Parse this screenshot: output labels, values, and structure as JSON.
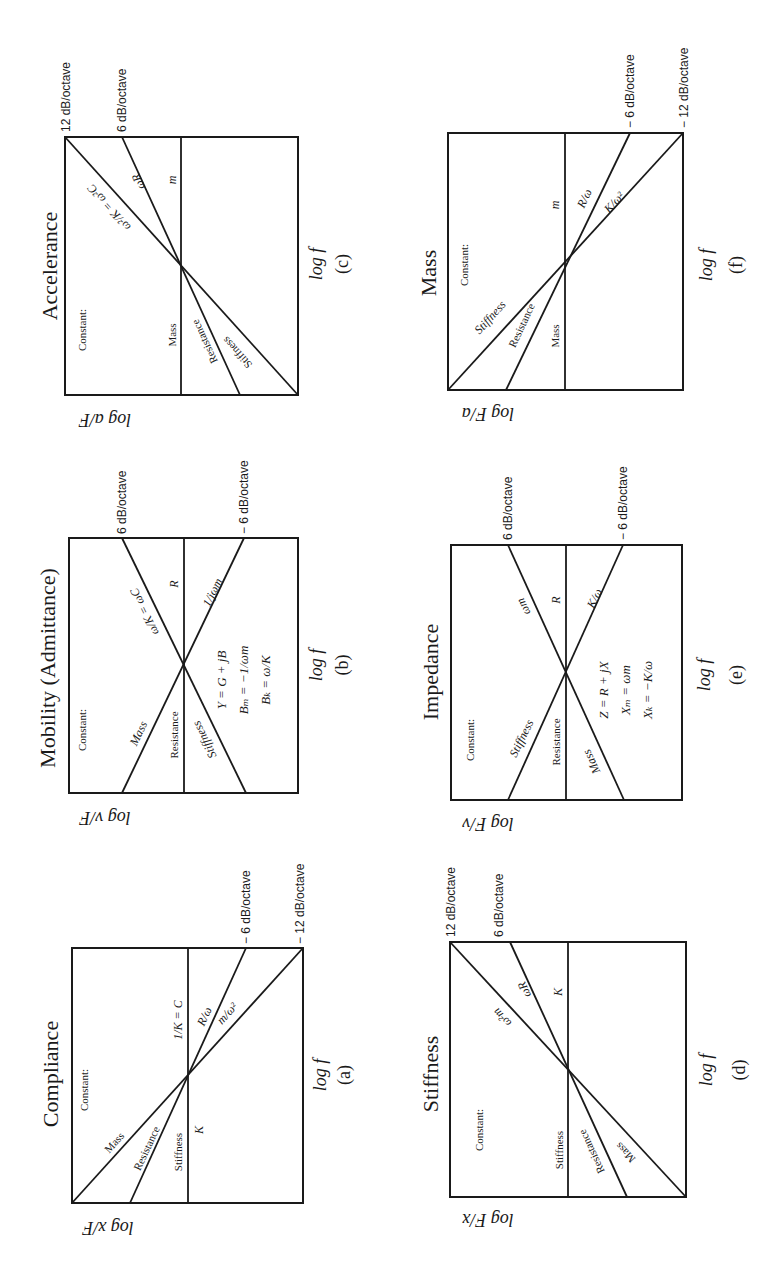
{
  "page": {
    "orientation": "rotated -90 degrees (landscape page scanned in portrait)",
    "background": "#ffffff",
    "ink": "#1a1a1a"
  },
  "common": {
    "x_axis_label": "log f",
    "constant_label": "Constant:"
  },
  "panels": [
    {
      "id": "a",
      "letter": "(a)",
      "title": "Compliance",
      "y_axis_label": "log x/F",
      "box": {
        "x1": 72,
        "x2": 303,
        "y1": 948,
        "y2": 1203
      },
      "lines": [
        {
          "from": [
            72,
            1203
          ],
          "to": [
            303,
            948
          ],
          "slope_label": "− 12 dB/octave"
        },
        {
          "from": [
            130,
            1203
          ],
          "to": [
            246,
            948
          ],
          "slope_label": "− 6 dB/octave"
        },
        {
          "from": [
            188,
            1203
          ],
          "to": [
            188,
            948
          ],
          "slope_label": ""
        }
      ],
      "low_freq_labels": [
        "Mass",
        "Resistance",
        "Stiffness"
      ],
      "high_freq_labels": [
        "m/ω²",
        "R/ω",
        "1/K = C"
      ],
      "extra_label": "K",
      "equations": []
    },
    {
      "id": "b",
      "letter": "(b)",
      "title": "Mobility (Admittance)",
      "y_axis_label": "log v/F",
      "box": {
        "x1": 69,
        "x2": 298,
        "y1": 538,
        "y2": 793
      },
      "lines": [
        {
          "from": [
            246,
            793
          ],
          "to": [
            122,
            538
          ],
          "slope_label": "6 dB/octave"
        },
        {
          "from": [
            122,
            793
          ],
          "to": [
            244,
            538
          ],
          "slope_label": "− 6 dB/octave"
        },
        {
          "from": [
            184,
            793
          ],
          "to": [
            184,
            538
          ],
          "slope_label": ""
        }
      ],
      "low_freq_labels": [
        "Mass",
        "Resistance",
        "Stiffness"
      ],
      "high_freq_labels": [
        "ω/K = ωC",
        "R",
        "1/jωm"
      ],
      "equations": [
        "Y = G + jB",
        "Bₘ = −1/ωm",
        "Bₖ = ω/K"
      ]
    },
    {
      "id": "c",
      "letter": "(c)",
      "title": "Accelerance",
      "y_axis_label": "log a/F",
      "box": {
        "x1": 65,
        "x2": 298,
        "y1": 137,
        "y2": 395
      },
      "lines": [
        {
          "from": [
            298,
            395
          ],
          "to": [
            65,
            137
          ],
          "slope_label": "12 dB/octave"
        },
        {
          "from": [
            240,
            395
          ],
          "to": [
            122,
            137
          ],
          "slope_label": "6 dB/octave"
        },
        {
          "from": [
            181,
            395
          ],
          "to": [
            181,
            137
          ],
          "slope_label": ""
        }
      ],
      "low_freq_labels": [
        "Mass",
        "Resistance",
        "Stiffness"
      ],
      "high_freq_labels": [
        "ω²/K = ω²C",
        "ωR",
        "m"
      ],
      "equations": []
    },
    {
      "id": "d",
      "letter": "(d)",
      "title": "Stiffness",
      "y_axis_label": "log F/x",
      "box": {
        "x1": 450,
        "x2": 686,
        "y1": 942,
        "y2": 1197
      },
      "lines": [
        {
          "from": [
            686,
            1197
          ],
          "to": [
            450,
            942
          ],
          "slope_label": "12 dB/octave"
        },
        {
          "from": [
            627,
            1197
          ],
          "to": [
            510,
            942
          ],
          "slope_label": "6 dB/octave"
        },
        {
          "from": [
            568,
            1197
          ],
          "to": [
            568,
            942
          ],
          "slope_label": ""
        }
      ],
      "low_freq_labels": [
        "Stiffness",
        "Resistance",
        "Mass"
      ],
      "high_freq_labels": [
        "ω²m",
        "ωR",
        "K"
      ],
      "equations": []
    },
    {
      "id": "e",
      "letter": "(e)",
      "title": "Impedance",
      "y_axis_label": "log F/v",
      "box": {
        "x1": 451,
        "x2": 682,
        "y1": 545,
        "y2": 800
      },
      "lines": [
        {
          "from": [
            624,
            800
          ],
          "to": [
            508,
            545
          ],
          "slope_label": "6 dB/octave"
        },
        {
          "from": [
            508,
            800
          ],
          "to": [
            623,
            545
          ],
          "slope_label": "− 6 dB/octave"
        },
        {
          "from": [
            566,
            800
          ],
          "to": [
            566,
            545
          ],
          "slope_label": ""
        }
      ],
      "low_freq_labels": [
        "Stiffness",
        "Resistance",
        "Mass"
      ],
      "high_freq_labels": [
        "ωm",
        "R",
        "K/ω"
      ],
      "equations": [
        "Z = R + jX",
        "Xₘ = ωm",
        "Xₖ = −K/ω"
      ]
    },
    {
      "id": "f",
      "letter": "(f)",
      "title": "Mass",
      "y_axis_label": "log F/a",
      "box": {
        "x1": 448,
        "x2": 683,
        "y1": 133,
        "y2": 390
      },
      "lines": [
        {
          "from": [
            448,
            390
          ],
          "to": [
            683,
            133
          ],
          "slope_label": "− 12 dB/octave"
        },
        {
          "from": [
            506,
            390
          ],
          "to": [
            630,
            133
          ],
          "slope_label": "− 6 dB/octave"
        },
        {
          "from": [
            565,
            390
          ],
          "to": [
            565,
            133
          ],
          "slope_label": ""
        }
      ],
      "low_freq_labels": [
        "Stiffness",
        "Resistance",
        "Mass"
      ],
      "high_freq_labels": [
        "K/ω²",
        "R/ω",
        "m"
      ],
      "equations": []
    }
  ]
}
